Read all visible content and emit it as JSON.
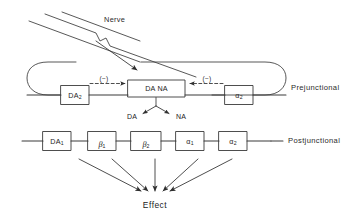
{
  "diagram": {
    "stroke_color": "#3a3a3a",
    "text_color": "#252525"
  },
  "nerve": {
    "label": "Nerve"
  },
  "rows": {
    "prejunctional": {
      "side_label": "Prejunctional",
      "boxes": [
        {
          "name": "box-da2",
          "text": "DA",
          "subscript": "2"
        },
        {
          "name": "box-da-na",
          "text": "DA  NA",
          "subscript": ""
        },
        {
          "name": "box-alpha2-pre",
          "text": "α",
          "subscript": "2"
        }
      ],
      "modulation": [
        {
          "name": "inhibition-left",
          "label": "(−)",
          "direction": "right"
        },
        {
          "name": "inhibition-right",
          "label": "(−)",
          "direction": "left"
        }
      ],
      "transmitters": [
        {
          "name": "transmitter-da",
          "label": "DA"
        },
        {
          "name": "transmitter-na",
          "label": "NA"
        }
      ]
    },
    "postjunctional": {
      "side_label": "Postjunctional",
      "boxes": [
        {
          "name": "box-da1",
          "text": "DA",
          "subscript": "1"
        },
        {
          "name": "box-beta1",
          "text": "β",
          "subscript": "1"
        },
        {
          "name": "box-beta2",
          "text": "β",
          "subscript": "2"
        },
        {
          "name": "box-alpha1",
          "text": "α",
          "subscript": "1"
        },
        {
          "name": "box-alpha2-post",
          "text": "α",
          "subscript": "2"
        }
      ]
    }
  },
  "effect": {
    "label": "Effect",
    "arrow_count": 5
  }
}
